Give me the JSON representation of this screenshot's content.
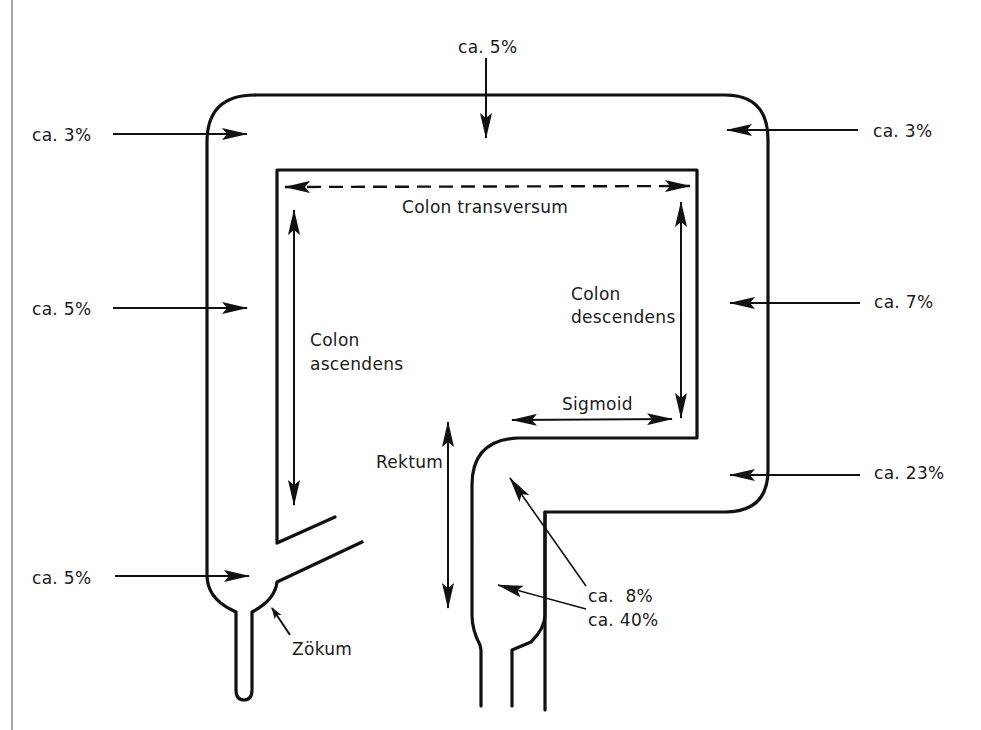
{
  "diagram": {
    "segments": {
      "transversum": "Colon transversum",
      "ascendens_1": "Colon",
      "ascendens_2": "ascendens",
      "descendens_1": "Colon",
      "descendens_2": "descendens",
      "sigmoid": "Sigmoid",
      "rektum": "Rektum",
      "zoekum": "Zökum"
    },
    "percentages": {
      "top_center": "ca. 5%",
      "top_left": "ca. 3%",
      "top_right": "ca. 3%",
      "mid_left": "ca. 5%",
      "mid_right": "ca. 7%",
      "lower_right": "ca. 23%",
      "bottom_left": "ca. 5%",
      "sigmoid_rektum": "ca.  8%",
      "rektum": "ca. 40%"
    },
    "colors": {
      "line": "#111111",
      "background": "#ffffff"
    }
  }
}
